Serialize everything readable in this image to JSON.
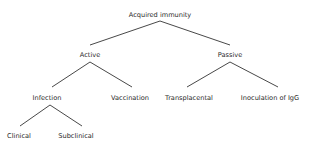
{
  "diagram": {
    "type": "tree",
    "line_color": "#333333",
    "text_color": "#2a2a2a",
    "nodes": {
      "root": {
        "label": "Acquired immunity",
        "x": 160,
        "y": 15
      },
      "active": {
        "label": "Active",
        "x": 90,
        "y": 55
      },
      "passive": {
        "label": "Passive",
        "x": 230,
        "y": 55
      },
      "infection": {
        "label": "Infection",
        "x": 47,
        "y": 98
      },
      "vaccination": {
        "label": "Vaccination",
        "x": 130,
        "y": 98
      },
      "transplacental": {
        "label": "Transplacental",
        "x": 189,
        "y": 98
      },
      "inoculation": {
        "label": "Inoculation of IgG",
        "x": 270,
        "y": 98
      },
      "clinical": {
        "label": "Clinical",
        "x": 19,
        "y": 136
      },
      "subclinical": {
        "label": "Subclinical",
        "x": 76,
        "y": 136
      }
    },
    "edges": [
      {
        "from": "root",
        "to": "active",
        "x1": 160,
        "y1": 21,
        "x2": 90,
        "y2": 45
      },
      {
        "from": "root",
        "to": "passive",
        "x1": 160,
        "y1": 21,
        "x2": 230,
        "y2": 45
      },
      {
        "from": "active",
        "to": "infection",
        "x1": 90,
        "y1": 62,
        "x2": 52,
        "y2": 87
      },
      {
        "from": "active",
        "to": "vaccination",
        "x1": 90,
        "y1": 62,
        "x2": 132,
        "y2": 87
      },
      {
        "from": "passive",
        "to": "transplacental",
        "x1": 230,
        "y1": 62,
        "x2": 187,
        "y2": 87
      },
      {
        "from": "passive",
        "to": "inoculation",
        "x1": 230,
        "y1": 62,
        "x2": 278,
        "y2": 87
      },
      {
        "from": "infection",
        "to": "clinical",
        "x1": 50,
        "y1": 105,
        "x2": 20,
        "y2": 126
      },
      {
        "from": "infection",
        "to": "subclinical",
        "x1": 50,
        "y1": 105,
        "x2": 82,
        "y2": 126
      }
    ]
  }
}
